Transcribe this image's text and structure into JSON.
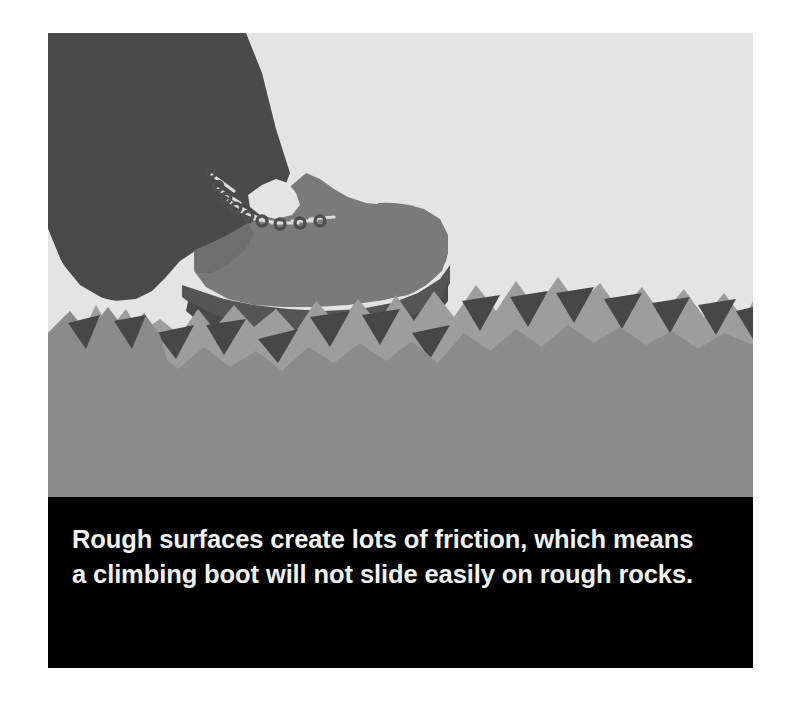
{
  "page": {
    "background_color": "#ffffff",
    "width": 790,
    "height": 703
  },
  "figure": {
    "frame": {
      "x": 48,
      "y": 33,
      "width": 705,
      "height": 635
    },
    "illustration": {
      "alt_description": "A climbing boot gripping a jagged rough rock surface",
      "sky_color": "#e4e4e4",
      "trouser_color": "#4a4a4a",
      "boot_upper_color": "#7a7a7a",
      "boot_sole_color": "#555555",
      "rock_body_color": "#8b8b8b",
      "rock_highlight_color": "#9d9d9d",
      "rock_shadow_color": "#474747",
      "lace_color": "#d8d8d8",
      "eyelet_color": "#4f4f4f",
      "elements": [
        "trouser-leg",
        "climbing-boot",
        "boot-laces",
        "boot-eyelets",
        "boot-sole",
        "jagged-rock-surface"
      ]
    },
    "caption": {
      "background_color": "#000000",
      "text_color": "#f2f2f2",
      "text": "Rough surfaces create lots of friction, which means a climbing boot will not slide easily on rough rocks.",
      "lines": [
        "Rough surfaces create lots of friction, which",
        "means a climbing boot will not slide easily on",
        "rough rocks."
      ]
    }
  }
}
